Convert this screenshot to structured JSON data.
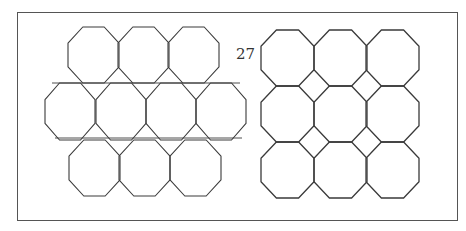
{
  "figure": {
    "label": "27",
    "stroke_color": "#3a3a3a",
    "frame": {
      "x": 17,
      "y": 12,
      "w": 441,
      "h": 209
    }
  },
  "left_pattern": {
    "description": "octagons-and-triangles tiling (staggered rows)",
    "rows": [
      {
        "y": 27,
        "h": 56,
        "cells_x": [
          68,
          118,
          168
        ],
        "w": 51
      },
      {
        "y": 83,
        "h": 57,
        "cells_x": [
          45,
          96,
          146,
          196
        ],
        "w": 50
      },
      {
        "y": 140,
        "h": 56,
        "cells_x": [
          69,
          119,
          170
        ],
        "w": 51
      }
    ]
  },
  "right_pattern": {
    "description": "octagons-and-squares tiling (3x3 grid)",
    "cols_x": [
      261,
      314,
      366
    ],
    "rows_y": [
      30,
      86,
      142
    ],
    "w": 53,
    "h": 56
  }
}
